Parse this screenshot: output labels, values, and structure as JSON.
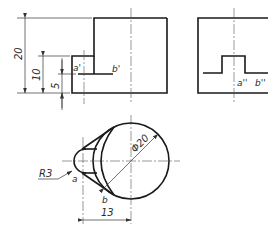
{
  "drawing": {
    "colors": {
      "line": "#1a1a1a",
      "thin": "#333333",
      "background": "#ffffff"
    },
    "front_view": {
      "points": {
        "a_prime": "a'",
        "b_prime": "b'"
      },
      "dimensions": {
        "height_total": "20",
        "height_mid": "10",
        "height_low": "5"
      }
    },
    "side_view": {
      "points": {
        "a_double_prime": "a''",
        "b_double_prime": "b''"
      }
    },
    "top_view": {
      "points": {
        "a": "a",
        "b": "b"
      },
      "dimensions": {
        "radius": "R3",
        "diameter": "Φ20",
        "length": "13"
      }
    }
  }
}
